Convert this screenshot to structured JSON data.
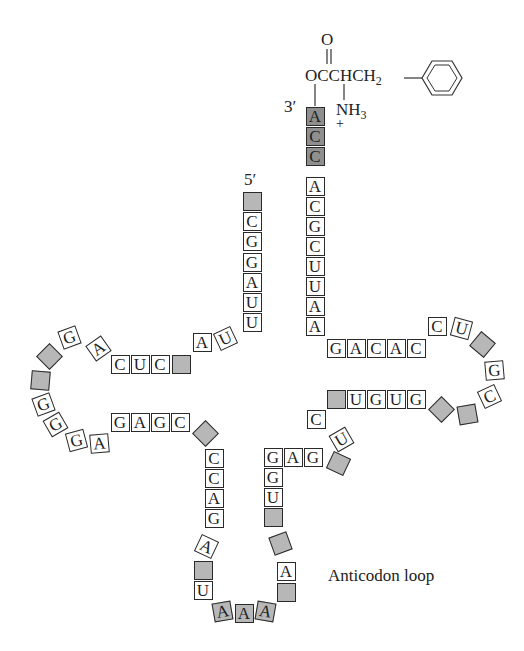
{
  "figure": {
    "labels": {
      "five_prime": "5′",
      "three_prime": "3′",
      "anticodon_loop": "Anticodon loop"
    },
    "amino_acid": {
      "carbonyl_o": "O",
      "ester_chain": "OCCHCH",
      "ch2_subscript": "2",
      "amine": "NH",
      "amine_subscript": "3",
      "charge": "+"
    },
    "colors": {
      "modified_base_fill": "#b7b7b7",
      "terminal_cca_fill": "#8f8f8f",
      "outline": "#2a2a2a",
      "background": "#ffffff"
    }
  },
  "nucleotides": [
    {
      "id": "n1",
      "base": "",
      "x": 252,
      "y": 201,
      "rot": 0,
      "fill": "mod"
    },
    {
      "id": "n2",
      "base": "C",
      "x": 252,
      "y": 221,
      "rot": 0,
      "fill": "none"
    },
    {
      "id": "n3",
      "base": "G",
      "x": 252,
      "y": 241,
      "rot": 0,
      "fill": "none"
    },
    {
      "id": "n4",
      "base": "G",
      "x": 252,
      "y": 262,
      "rot": 0,
      "fill": "none"
    },
    {
      "id": "n5",
      "base": "A",
      "x": 252,
      "y": 282,
      "rot": 0,
      "fill": "none"
    },
    {
      "id": "n6",
      "base": "U",
      "x": 252,
      "y": 302,
      "rot": 0,
      "fill": "none"
    },
    {
      "id": "n7",
      "base": "U",
      "x": 252,
      "y": 322,
      "rot": 0,
      "fill": "none"
    },
    {
      "id": "n8",
      "base": "U",
      "x": 225,
      "y": 338,
      "rot": -25,
      "fill": "none"
    },
    {
      "id": "n9",
      "base": "A",
      "x": 202,
      "y": 342,
      "rot": 0,
      "fill": "none"
    },
    {
      "id": "n10",
      "base": "",
      "x": 181,
      "y": 364,
      "rot": 0,
      "fill": "mod"
    },
    {
      "id": "n11",
      "base": "C",
      "x": 160,
      "y": 364,
      "rot": 0,
      "fill": "none"
    },
    {
      "id": "n12",
      "base": "U",
      "x": 140,
      "y": 364,
      "rot": 0,
      "fill": "none"
    },
    {
      "id": "n13",
      "base": "C",
      "x": 120,
      "y": 364,
      "rot": 0,
      "fill": "none"
    },
    {
      "id": "n14",
      "base": "A",
      "x": 98,
      "y": 348,
      "rot": -35,
      "fill": "none"
    },
    {
      "id": "n15",
      "base": "G",
      "x": 69,
      "y": 337,
      "rot": -20,
      "fill": "none"
    },
    {
      "id": "n16",
      "base": "",
      "x": 49,
      "y": 356,
      "rot": 45,
      "fill": "mod"
    },
    {
      "id": "n17",
      "base": "",
      "x": 40,
      "y": 380,
      "rot": 5,
      "fill": "mod"
    },
    {
      "id": "n18",
      "base": "G",
      "x": 43,
      "y": 404,
      "rot": -20,
      "fill": "none"
    },
    {
      "id": "n19",
      "base": "G",
      "x": 55,
      "y": 424,
      "rot": -30,
      "fill": "none"
    },
    {
      "id": "n20",
      "base": "G",
      "x": 76,
      "y": 440,
      "rot": -15,
      "fill": "none"
    },
    {
      "id": "n21",
      "base": "A",
      "x": 99,
      "y": 443,
      "rot": -5,
      "fill": "none"
    },
    {
      "id": "n22",
      "base": "G",
      "x": 120,
      "y": 422,
      "rot": 0,
      "fill": "none"
    },
    {
      "id": "n23",
      "base": "A",
      "x": 140,
      "y": 422,
      "rot": 0,
      "fill": "none"
    },
    {
      "id": "n24",
      "base": "G",
      "x": 160,
      "y": 422,
      "rot": 0,
      "fill": "none"
    },
    {
      "id": "n25",
      "base": "C",
      "x": 180,
      "y": 422,
      "rot": 0,
      "fill": "none"
    },
    {
      "id": "n26",
      "base": "",
      "x": 205,
      "y": 433,
      "rot": 45,
      "fill": "mod"
    },
    {
      "id": "n27",
      "base": "C",
      "x": 214,
      "y": 458,
      "rot": 0,
      "fill": "none"
    },
    {
      "id": "n28",
      "base": "C",
      "x": 214,
      "y": 478,
      "rot": 0,
      "fill": "none"
    },
    {
      "id": "n29",
      "base": "A",
      "x": 214,
      "y": 498,
      "rot": 0,
      "fill": "none"
    },
    {
      "id": "n30",
      "base": "G",
      "x": 214,
      "y": 518,
      "rot": 0,
      "fill": "none"
    },
    {
      "id": "n31",
      "base": "A",
      "x": 206,
      "y": 546,
      "rot": 25,
      "fill": "none"
    },
    {
      "id": "n32",
      "base": "",
      "x": 203,
      "y": 570,
      "rot": 0,
      "fill": "mod"
    },
    {
      "id": "n33",
      "base": "U",
      "x": 203,
      "y": 590,
      "rot": 0,
      "fill": "none"
    },
    {
      "id": "n34",
      "base": "A",
      "x": 222,
      "y": 611,
      "rot": -10,
      "fill": "mod"
    },
    {
      "id": "n35",
      "base": "A",
      "x": 244,
      "y": 613,
      "rot": 0,
      "fill": "mod"
    },
    {
      "id": "n36",
      "base": "A",
      "x": 265,
      "y": 611,
      "rot": 10,
      "fill": "mod"
    },
    {
      "id": "n37",
      "base": "",
      "x": 286,
      "y": 592,
      "rot": 0,
      "fill": "mod"
    },
    {
      "id": "n38",
      "base": "A",
      "x": 286,
      "y": 571,
      "rot": 0,
      "fill": "none"
    },
    {
      "id": "n39",
      "base": "",
      "x": 280,
      "y": 543,
      "rot": -20,
      "fill": "mod"
    },
    {
      "id": "n40",
      "base": "",
      "x": 273,
      "y": 517,
      "rot": 0,
      "fill": "mod"
    },
    {
      "id": "n41",
      "base": "U",
      "x": 273,
      "y": 497,
      "rot": 0,
      "fill": "none"
    },
    {
      "id": "n42",
      "base": "G",
      "x": 273,
      "y": 477,
      "rot": 0,
      "fill": "none"
    },
    {
      "id": "n43",
      "base": "G",
      "x": 273,
      "y": 457,
      "rot": 0,
      "fill": "none"
    },
    {
      "id": "n44",
      "base": "A",
      "x": 293,
      "y": 457,
      "rot": 0,
      "fill": "none"
    },
    {
      "id": "n45",
      "base": "G",
      "x": 313,
      "y": 457,
      "rot": 0,
      "fill": "none"
    },
    {
      "id": "n46",
      "base": "",
      "x": 338,
      "y": 463,
      "rot": 25,
      "fill": "mod"
    },
    {
      "id": "n47",
      "base": "U",
      "x": 341,
      "y": 439,
      "rot": -30,
      "fill": "none"
    },
    {
      "id": "n48",
      "base": "C",
      "x": 316,
      "y": 419,
      "rot": 0,
      "fill": "none"
    },
    {
      "id": "n49",
      "base": "",
      "x": 336,
      "y": 399,
      "rot": 0,
      "fill": "mod"
    },
    {
      "id": "n50",
      "base": "U",
      "x": 356,
      "y": 399,
      "rot": 0,
      "fill": "none"
    },
    {
      "id": "n51",
      "base": "G",
      "x": 376,
      "y": 399,
      "rot": 0,
      "fill": "none"
    },
    {
      "id": "n52",
      "base": "U",
      "x": 396,
      "y": 399,
      "rot": 0,
      "fill": "none"
    },
    {
      "id": "n53",
      "base": "G",
      "x": 416,
      "y": 399,
      "rot": 0,
      "fill": "none"
    },
    {
      "id": "n54",
      "base": "",
      "x": 441,
      "y": 409,
      "rot": 45,
      "fill": "mod"
    },
    {
      "id": "n55",
      "base": "",
      "x": 467,
      "y": 414,
      "rot": -10,
      "fill": "mod"
    },
    {
      "id": "n56",
      "base": "C",
      "x": 489,
      "y": 396,
      "rot": -25,
      "fill": "none"
    },
    {
      "id": "n57",
      "base": "G",
      "x": 494,
      "y": 370,
      "rot": -5,
      "fill": "none"
    },
    {
      "id": "n58",
      "base": "",
      "x": 482,
      "y": 344,
      "rot": 40,
      "fill": "mod"
    },
    {
      "id": "n59",
      "base": "U",
      "x": 461,
      "y": 328,
      "rot": 15,
      "fill": "none"
    },
    {
      "id": "n60",
      "base": "C",
      "x": 437,
      "y": 326,
      "rot": 0,
      "fill": "none"
    },
    {
      "id": "n61",
      "base": "C",
      "x": 416,
      "y": 348,
      "rot": 0,
      "fill": "none"
    },
    {
      "id": "n62",
      "base": "A",
      "x": 396,
      "y": 348,
      "rot": 0,
      "fill": "none"
    },
    {
      "id": "n63",
      "base": "C",
      "x": 376,
      "y": 348,
      "rot": 0,
      "fill": "none"
    },
    {
      "id": "n64",
      "base": "A",
      "x": 356,
      "y": 348,
      "rot": 0,
      "fill": "none"
    },
    {
      "id": "n65",
      "base": "G",
      "x": 336,
      "y": 348,
      "rot": 0,
      "fill": "none"
    },
    {
      "id": "n66",
      "base": "A",
      "x": 315,
      "y": 326,
      "rot": 0,
      "fill": "none"
    },
    {
      "id": "n67",
      "base": "A",
      "x": 315,
      "y": 306,
      "rot": 0,
      "fill": "none"
    },
    {
      "id": "n68",
      "base": "U",
      "x": 315,
      "y": 286,
      "rot": 0,
      "fill": "none"
    },
    {
      "id": "n69",
      "base": "U",
      "x": 315,
      "y": 266,
      "rot": 0,
      "fill": "none"
    },
    {
      "id": "n70",
      "base": "C",
      "x": 315,
      "y": 246,
      "rot": 0,
      "fill": "none"
    },
    {
      "id": "n71",
      "base": "G",
      "x": 315,
      "y": 226,
      "rot": 0,
      "fill": "none"
    },
    {
      "id": "n72",
      "base": "C",
      "x": 315,
      "y": 206,
      "rot": 0,
      "fill": "none"
    },
    {
      "id": "n73",
      "base": "A",
      "x": 315,
      "y": 186,
      "rot": 0,
      "fill": "none"
    },
    {
      "id": "n74",
      "base": "C",
      "x": 315,
      "y": 156,
      "rot": 0,
      "fill": "dark"
    },
    {
      "id": "n75",
      "base": "C",
      "x": 315,
      "y": 136,
      "rot": 0,
      "fill": "dark"
    },
    {
      "id": "n76",
      "base": "A",
      "x": 315,
      "y": 116,
      "rot": 0,
      "fill": "dark"
    }
  ]
}
